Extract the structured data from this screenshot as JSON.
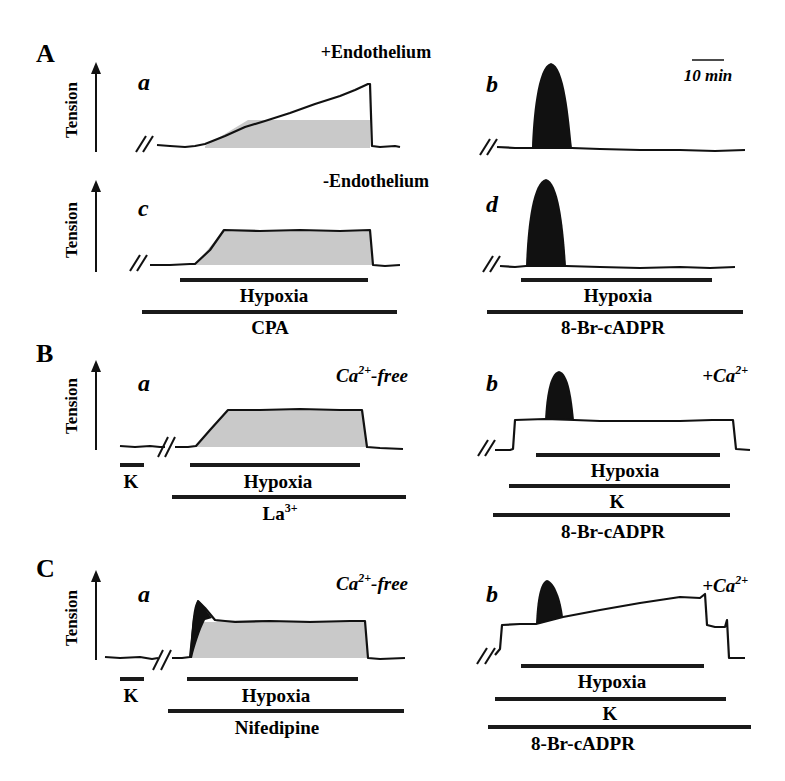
{
  "figure": {
    "panels": {
      "A": {
        "letter": "A",
        "y_axis_label": "Tension",
        "scale_bar": "10 min",
        "conditions": {
          "top": "+Endothelium",
          "bottom": "-Endothelium"
        },
        "subpanels": {
          "a": {
            "letter": "a"
          },
          "b": {
            "letter": "b"
          },
          "c": {
            "letter": "c"
          },
          "d": {
            "letter": "d"
          }
        },
        "bars_left": {
          "hypoxia": "Hypoxia",
          "drug": "CPA"
        },
        "bars_right": {
          "hypoxia": "Hypoxia",
          "drug": "8-Br-cADPR"
        }
      },
      "B": {
        "letter": "B",
        "y_axis_label": "Tension",
        "left": {
          "letter": "a",
          "condition": "Ca",
          "condition_sup": "2+",
          "condition_suffix": "-free",
          "k": "K",
          "hypoxia": "Hypoxia",
          "drug": "La",
          "drug_sup": "3+"
        },
        "right": {
          "letter": "b",
          "condition": "+Ca",
          "condition_sup": "2+",
          "hypoxia": "Hypoxia",
          "k": "K",
          "drug": "8-Br-cADPR"
        }
      },
      "C": {
        "letter": "C",
        "y_axis_label": "Tension",
        "left": {
          "letter": "a",
          "condition": "Ca",
          "condition_sup": "2+",
          "condition_suffix": "-free",
          "k": "K",
          "hypoxia": "Hypoxia",
          "drug": "Nifedipine"
        },
        "right": {
          "letter": "b",
          "condition": "+Ca",
          "condition_sup": "2+",
          "hypoxia": "Hypoxia",
          "k": "K",
          "drug": "8-Br-cADPR"
        }
      }
    }
  }
}
